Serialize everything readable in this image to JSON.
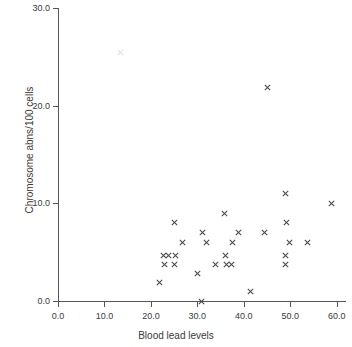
{
  "chart_data": {
    "type": "scatter",
    "title": "",
    "xlabel": "Blood lead levels",
    "ylabel": "Chromosome abns/100 cells",
    "xlim": [
      0.0,
      62.0
    ],
    "ylim": [
      0.0,
      30.0
    ],
    "grid": false,
    "legend": "none",
    "marker": "x",
    "marker_color": "#4a4a4a",
    "xticks": [
      "0.0",
      "10.0",
      "20.0",
      "30.0",
      "40.0",
      "50.0",
      "60.0"
    ],
    "xtick_values": [
      0.0,
      10.0,
      20.0,
      30.0,
      40.0,
      50.0,
      60.0
    ],
    "yticks": [
      "0.0",
      "10.0",
      "20.0",
      "30.0"
    ],
    "ytick_values": [
      0.0,
      10.0,
      20.0,
      30.0
    ],
    "series": [
      {
        "name": "subjects",
        "points": [
          [
            13.5,
            25.4
          ],
          [
            45.2,
            21.9
          ],
          [
            49.0,
            11.0
          ],
          [
            58.8,
            10.0
          ],
          [
            35.8,
            9.0
          ],
          [
            25.0,
            8.0
          ],
          [
            49.2,
            8.0
          ],
          [
            31.2,
            7.0
          ],
          [
            38.8,
            7.0
          ],
          [
            44.5,
            7.0
          ],
          [
            26.8,
            6.0
          ],
          [
            32.0,
            6.0
          ],
          [
            37.5,
            6.0
          ],
          [
            49.8,
            6.0
          ],
          [
            53.8,
            6.0
          ],
          [
            22.8,
            4.7
          ],
          [
            23.8,
            4.7
          ],
          [
            25.2,
            4.7
          ],
          [
            36.0,
            4.7
          ],
          [
            49.0,
            4.7
          ],
          [
            23.0,
            3.7
          ],
          [
            25.0,
            3.7
          ],
          [
            34.0,
            3.7
          ],
          [
            36.2,
            3.7
          ],
          [
            37.3,
            3.7
          ],
          [
            49.0,
            3.7
          ],
          [
            30.0,
            2.8
          ],
          [
            21.8,
            1.9
          ],
          [
            41.5,
            1.0
          ],
          [
            30.8,
            0.0
          ]
        ]
      }
    ]
  },
  "axes": {
    "x_title": "Blood lead levels",
    "y_title": "Chromosome abns/100 cells"
  }
}
